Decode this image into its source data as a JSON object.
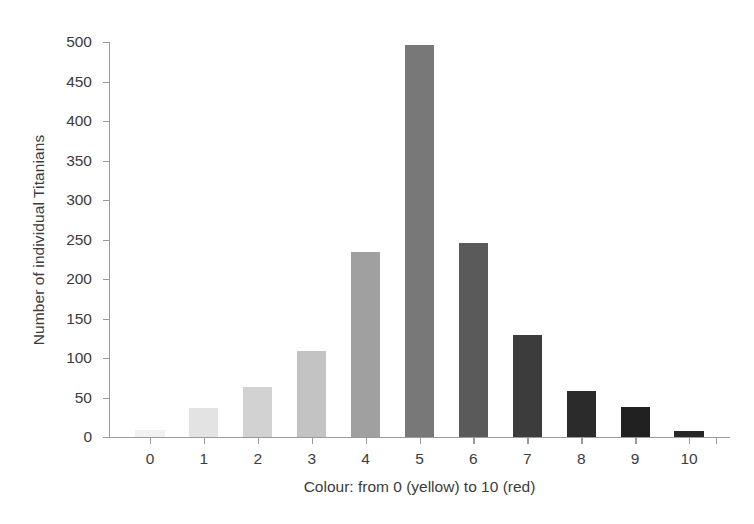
{
  "chart_data": {
    "type": "bar",
    "title": "",
    "subtitle": "",
    "xlabel": "Colour: from 0 (yellow) to 10 (red)",
    "ylabel": "Number of individual Titanians",
    "categories": [
      "0",
      "1",
      "2",
      "3",
      "4",
      "5",
      "6",
      "7",
      "8",
      "9",
      "10"
    ],
    "values": [
      9,
      37,
      63,
      109,
      234,
      496,
      246,
      129,
      58,
      38,
      8
    ],
    "bar_colors": [
      "#f1f1f1",
      "#e3e3e3",
      "#d2d2d2",
      "#c3c3c3",
      "#a0a0a0",
      "#787878",
      "#5a5a5a",
      "#3c3c3c",
      "#2b2b2b",
      "#212121",
      "#272727"
    ],
    "ylim": [
      0,
      500
    ],
    "y_ticks": [
      "0",
      "50",
      "100",
      "150",
      "200",
      "250",
      "300",
      "350",
      "400",
      "450",
      "500"
    ],
    "y_tick_values": [
      0,
      50,
      100,
      150,
      200,
      250,
      300,
      350,
      400,
      450,
      500
    ],
    "x_ticks": [
      "0",
      "1",
      "2",
      "3",
      "4",
      "5",
      "6",
      "7",
      "8",
      "9",
      "10"
    ],
    "grid": false,
    "legend": null,
    "legend_position": "none",
    "annotations": [],
    "axis_color": "#9a9a9a",
    "text_color": "#3c3c3c",
    "background": "#ffffff"
  }
}
